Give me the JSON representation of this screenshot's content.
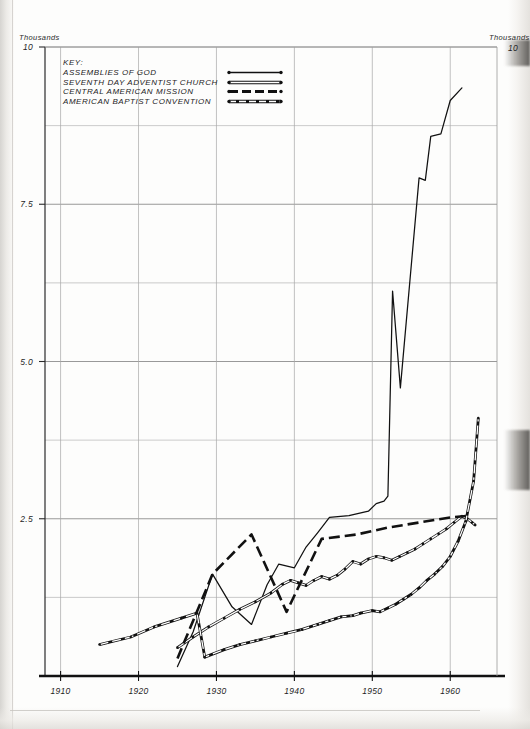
{
  "axes": {
    "y_caption_left": "Thousands",
    "y_caption_right": "Thousands",
    "y_tick_labels": [
      "10",
      "7.5",
      "5.0",
      "2.5"
    ],
    "y_tick_values": [
      10,
      7.5,
      5.0,
      2.5
    ],
    "y_top_right_label": "10",
    "x_tick_labels": [
      "1910",
      "1920",
      "1930",
      "1940",
      "1950",
      "1960"
    ],
    "x_tick_values": [
      1910,
      1920,
      1930,
      1940,
      1950,
      1960
    ]
  },
  "legend": {
    "title": "KEY:",
    "items": [
      {
        "label": "ASSEMBLIES OF GOD",
        "style": "solid",
        "color": "#111111"
      },
      {
        "label": "SEVENTH DAY ADVENTIST CHURCH",
        "style": "double",
        "color": "#111111"
      },
      {
        "label": "CENTRAL AMERICAN MISSION",
        "style": "dashed",
        "color": "#111111"
      },
      {
        "label": "AMERICAN BAPTIST CONVENTION",
        "style": "dashdot",
        "color": "#111111"
      }
    ]
  },
  "chart_data": {
    "type": "line",
    "title": "",
    "subtitle": "",
    "xlabel": "",
    "ylabel": "Thousands",
    "xlim": [
      1908,
      1966
    ],
    "ylim": [
      0,
      10
    ],
    "grid": true,
    "grid_y_step": 1.25,
    "legend_position": "top-left inside plot",
    "annotations": [
      "Y axis labelled in Thousands on both left and right sides",
      "Right-hand caption is clipped by the page edge"
    ],
    "series": [
      {
        "name": "ASSEMBLIES OF GOD",
        "style": "solid",
        "color": "#111111",
        "points": [
          [
            1925.0,
            0.15
          ],
          [
            1927.0,
            0.7
          ],
          [
            1929.5,
            1.62
          ],
          [
            1932.0,
            1.1
          ],
          [
            1934.5,
            0.82
          ],
          [
            1936.5,
            1.45
          ],
          [
            1938.0,
            1.78
          ],
          [
            1940.0,
            1.72
          ],
          [
            1941.5,
            2.05
          ],
          [
            1943.0,
            2.28
          ],
          [
            1944.5,
            2.52
          ],
          [
            1947.0,
            2.55
          ],
          [
            1949.5,
            2.62
          ],
          [
            1950.5,
            2.74
          ],
          [
            1951.5,
            2.78
          ],
          [
            1952.0,
            2.86
          ],
          [
            1952.6,
            6.12
          ],
          [
            1953.6,
            4.58
          ],
          [
            1956.0,
            7.92
          ],
          [
            1956.8,
            7.88
          ],
          [
            1957.5,
            8.58
          ],
          [
            1958.8,
            8.62
          ],
          [
            1960.0,
            9.15
          ],
          [
            1961.5,
            9.35
          ]
        ]
      },
      {
        "name": "SEVENTH DAY ADVENTIST CHURCH",
        "style": "double",
        "color": "#111111",
        "points": [
          [
            1925.0,
            0.45
          ],
          [
            1927.0,
            0.62
          ],
          [
            1929.0,
            0.78
          ],
          [
            1931.0,
            0.92
          ],
          [
            1933.0,
            1.06
          ],
          [
            1935.0,
            1.18
          ],
          [
            1937.0,
            1.32
          ],
          [
            1938.5,
            1.46
          ],
          [
            1939.5,
            1.52
          ],
          [
            1940.5,
            1.48
          ],
          [
            1941.5,
            1.44
          ],
          [
            1942.5,
            1.52
          ],
          [
            1943.5,
            1.58
          ],
          [
            1944.5,
            1.54
          ],
          [
            1945.5,
            1.6
          ],
          [
            1946.5,
            1.7
          ],
          [
            1947.5,
            1.82
          ],
          [
            1948.5,
            1.78
          ],
          [
            1949.5,
            1.86
          ],
          [
            1950.5,
            1.9
          ],
          [
            1951.5,
            1.88
          ],
          [
            1952.5,
            1.84
          ],
          [
            1953.5,
            1.9
          ],
          [
            1954.5,
            1.96
          ],
          [
            1955.5,
            2.02
          ],
          [
            1956.5,
            2.1
          ],
          [
            1957.5,
            2.18
          ],
          [
            1958.5,
            2.26
          ],
          [
            1959.5,
            2.34
          ],
          [
            1960.5,
            2.44
          ],
          [
            1961.5,
            2.54
          ],
          [
            1962.2,
            2.5
          ],
          [
            1962.8,
            2.44
          ],
          [
            1963.2,
            2.4
          ]
        ]
      },
      {
        "name": "CENTRAL AMERICAN MISSION",
        "style": "dashed",
        "color": "#111111",
        "points": [
          [
            1925.0,
            0.28
          ],
          [
            1929.5,
            1.62
          ],
          [
            1934.5,
            2.25
          ],
          [
            1939.0,
            1.02
          ],
          [
            1943.5,
            2.18
          ],
          [
            1948.0,
            2.25
          ],
          [
            1952.0,
            2.36
          ],
          [
            1956.0,
            2.44
          ],
          [
            1960.0,
            2.52
          ],
          [
            1962.5,
            2.55
          ]
        ]
      },
      {
        "name": "AMERICAN BAPTIST CONVENTION",
        "style": "dashdot",
        "color": "#111111",
        "points": [
          [
            1915.0,
            0.5
          ],
          [
            1919.0,
            0.62
          ],
          [
            1922.0,
            0.78
          ],
          [
            1925.5,
            0.92
          ],
          [
            1927.5,
            1.0
          ],
          [
            1928.5,
            0.3
          ],
          [
            1931.0,
            0.42
          ],
          [
            1933.0,
            0.5
          ],
          [
            1935.0,
            0.56
          ],
          [
            1937.0,
            0.62
          ],
          [
            1939.0,
            0.68
          ],
          [
            1941.0,
            0.74
          ],
          [
            1943.0,
            0.82
          ],
          [
            1944.5,
            0.88
          ],
          [
            1946.0,
            0.94
          ],
          [
            1947.5,
            0.96
          ],
          [
            1948.5,
            1.0
          ],
          [
            1950.0,
            1.04
          ],
          [
            1951.0,
            1.02
          ],
          [
            1952.0,
            1.08
          ],
          [
            1953.0,
            1.14
          ],
          [
            1954.0,
            1.22
          ],
          [
            1955.0,
            1.3
          ],
          [
            1956.0,
            1.4
          ],
          [
            1957.0,
            1.52
          ],
          [
            1958.0,
            1.62
          ],
          [
            1959.0,
            1.74
          ],
          [
            1960.0,
            1.9
          ],
          [
            1961.0,
            2.14
          ],
          [
            1962.0,
            2.46
          ],
          [
            1963.0,
            3.1
          ],
          [
            1963.6,
            4.1
          ]
        ]
      }
    ]
  }
}
